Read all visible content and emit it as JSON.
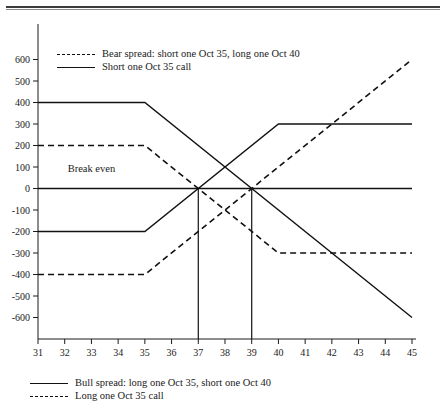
{
  "figure": {
    "top_rule": true
  },
  "chart_data": {
    "type": "line",
    "title": "",
    "xlabel": "",
    "ylabel": "",
    "xlim": [
      31,
      45
    ],
    "ylim": [
      -700,
      700
    ],
    "xticks": [
      31,
      32,
      33,
      34,
      35,
      36,
      37,
      38,
      39,
      40,
      41,
      42,
      43,
      44,
      45
    ],
    "yticks": [
      600,
      500,
      400,
      300,
      200,
      100,
      0,
      -100,
      -200,
      -300,
      -400,
      -500,
      -600
    ],
    "ytick_labels": [
      "600",
      "500",
      "400",
      "300",
      "200",
      "100",
      "0",
      "-100",
      "-200",
      "-300",
      "-400",
      "-500",
      "-600"
    ],
    "xtick_labels": [
      "31",
      "32",
      "33",
      "34",
      "35",
      "36",
      "37",
      "38",
      "39",
      "40",
      "41",
      "42",
      "43",
      "44",
      "45"
    ],
    "grid": false,
    "legend_position": "inside-top-left and below-axes",
    "series": [
      {
        "name": "Short one Oct 35 call",
        "style": "solid",
        "x": [
          31,
          35,
          45
        ],
        "values": [
          400,
          400,
          -600
        ]
      },
      {
        "name": "Long one Oct 35 call",
        "style": "dashed",
        "x": [
          31,
          35,
          45
        ],
        "values": [
          -400,
          -400,
          600
        ]
      },
      {
        "name": "Bull spread: long one Oct 35, short one Oct 40",
        "style": "solid",
        "x": [
          31,
          35,
          40,
          45
        ],
        "values": [
          -200,
          -200,
          300,
          300
        ]
      },
      {
        "name": "Bear spread: short one Oct 35, long one Oct 40",
        "style": "dashed",
        "x": [
          31,
          35,
          40,
          45
        ],
        "values": [
          200,
          200,
          -300,
          -300
        ]
      },
      {
        "name": "Zero line",
        "style": "solid",
        "x": [
          31,
          45
        ],
        "values": [
          0,
          0
        ]
      }
    ],
    "annotations": [
      {
        "text": "Break even",
        "x": 33.0,
        "y": 75
      }
    ],
    "markers": [
      {
        "x": 37,
        "from_y": 0,
        "to_y": -700
      },
      {
        "x": 39,
        "from_y": 0,
        "to_y": -700
      }
    ]
  },
  "legend_top": {
    "items": [
      {
        "style": "dashed",
        "label": "Bear spread: short one Oct 35, long one Oct 40"
      },
      {
        "style": "solid",
        "label": "Short one Oct 35 call"
      }
    ]
  },
  "legend_bottom": {
    "items": [
      {
        "style": "solid",
        "label": "Bull spread: long one Oct 35, short one Oct 40"
      },
      {
        "style": "dashed",
        "label": "Long one Oct 35 call"
      }
    ]
  }
}
